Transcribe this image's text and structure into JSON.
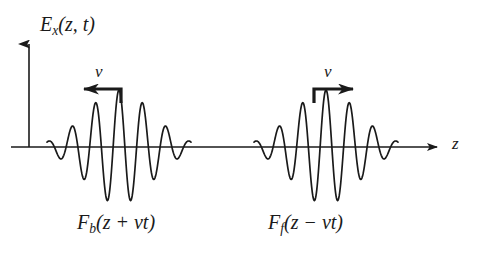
{
  "figure": {
    "background_color": "#ffffff",
    "stroke_color": "#1a1a1a",
    "width": 479,
    "height": 270
  },
  "axes": {
    "vertical_axis_label": "E",
    "vertical_axis_label_sub": "x",
    "vertical_axis_label_args": "(z, t)",
    "horizontal_axis_label": "z",
    "origin_x": 29,
    "baseline_y": 147,
    "vertical_axis_top_y": 37,
    "horizontal_axis_end_x": 446
  },
  "velocity_markers": [
    {
      "name": "backward-velocity",
      "label": "v",
      "direction": "left",
      "arrow_tip_x": 84,
      "arrow_tail_x": 121,
      "arrow_y": 89,
      "stem_bottom_y": 103
    },
    {
      "name": "forward-velocity",
      "label": "v",
      "direction": "right",
      "arrow_tip_x": 353,
      "arrow_tail_x": 314,
      "arrow_y": 89,
      "stem_bottom_y": 103
    }
  ],
  "packets": [
    {
      "name": "backward-packet",
      "label_function": "F",
      "label_sub": "b",
      "label_args": "(z + vt)",
      "center_x": 119,
      "half_width": 72,
      "amplitude": 57,
      "wavelength": 23.5,
      "phase_deg": 0,
      "direction": "left"
    },
    {
      "name": "forward-packet",
      "label_function": "F",
      "label_sub": "f",
      "label_args": "(z − vt)",
      "center_x": 326,
      "half_width": 72,
      "amplitude": 57,
      "wavelength": 23.5,
      "phase_deg": 0,
      "direction": "right"
    }
  ],
  "chart_data": {
    "type": "line",
    "title": "",
    "xlabel": "z",
    "ylabel": "E_x(z,t)",
    "grid": false,
    "legend": "none",
    "series": [
      {
        "name": "F_b(z + vt)",
        "envelope": "gaussian",
        "center": 119,
        "sigma": 33,
        "amplitude": 57,
        "wavelength": 23.5
      },
      {
        "name": "F_f(z - vt)",
        "envelope": "gaussian",
        "center": 326,
        "sigma": 33,
        "amplitude": 57,
        "wavelength": 23.5
      }
    ]
  }
}
